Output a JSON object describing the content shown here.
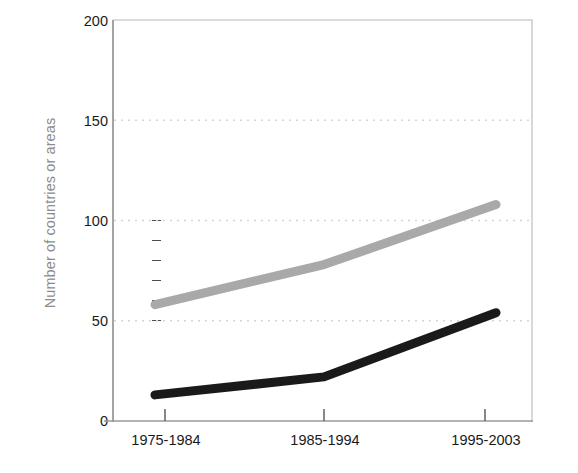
{
  "chart_data": {
    "type": "line",
    "title": "",
    "subtitle": "",
    "xlabel": "",
    "ylabel": "Number of countries or areas",
    "categories": [
      "1975-1984",
      "1985-1994",
      "1995-2003"
    ],
    "series": [
      {
        "name": "series-gray",
        "color": "#a9a9a9",
        "values": [
          58,
          78,
          108
        ]
      },
      {
        "name": "series-black",
        "color": "#1a1a1a",
        "values": [
          13,
          22,
          54
        ]
      }
    ],
    "ylim": [
      0,
      200
    ],
    "y_major_ticks": [
      0,
      50,
      100,
      150,
      200
    ],
    "y_major_tick_labels": [
      "0",
      "50",
      "100",
      "150",
      "200"
    ],
    "y_minor_ticks": [
      50,
      60,
      70,
      80,
      90,
      100
    ],
    "gridlines": [
      50,
      100,
      150
    ],
    "grid": "horizontal-dotted",
    "legend": "none",
    "legend_position": "none",
    "annotations": []
  },
  "style": {
    "background": "#ffffff",
    "axis_color": "#9a9a9a",
    "left_axis_color": "#8a8a8a",
    "grid_color": "#d8d8d8",
    "tick_color": "#4d4d4d",
    "label_color": "#1a1a1a",
    "axis_title_color": "#8c8c8c"
  }
}
